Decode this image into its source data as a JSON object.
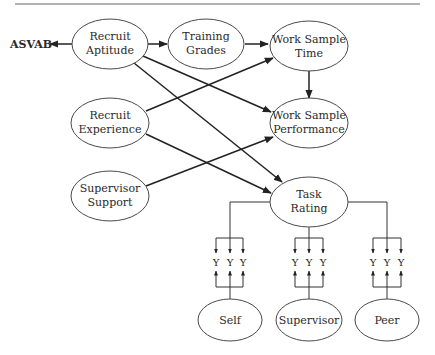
{
  "diagram": {
    "header_rule": true,
    "external_indicator": {
      "label": "ASVAB"
    },
    "nodes": {
      "recruit_aptitude": {
        "line1": "Recruit",
        "line2": "Aptitude"
      },
      "training_grades": {
        "line1": "Training",
        "line2": "Grades"
      },
      "work_sample_time": {
        "line1": "Work Sample",
        "line2": "Time"
      },
      "recruit_experience": {
        "line1": "Recruit",
        "line2": "Experience"
      },
      "work_sample_performance": {
        "line1": "Work Sample",
        "line2": "Performance"
      },
      "supervisor_support": {
        "line1": "Supervisor",
        "line2": "Support"
      },
      "task_rating": {
        "line1": "Task",
        "line2": "Rating"
      },
      "self": {
        "label": "Self"
      },
      "supervisor": {
        "label": "Supervisor"
      },
      "peer": {
        "label": "Peer"
      }
    },
    "indicators": {
      "group_left": [
        "Y",
        "Y",
        "Y"
      ],
      "group_middle": [
        "Y",
        "Y",
        "Y"
      ],
      "group_right": [
        "Y",
        "Y",
        "Y"
      ]
    },
    "edges": [
      {
        "from": "Recruit Aptitude",
        "to": "ASVAB"
      },
      {
        "from": "Recruit Aptitude",
        "to": "Training Grades"
      },
      {
        "from": "Training Grades",
        "to": "Work Sample Time"
      },
      {
        "from": "Work Sample Time",
        "to": "Work Sample Performance"
      },
      {
        "from": "Recruit Aptitude",
        "to": "Work Sample Performance"
      },
      {
        "from": "Recruit Aptitude",
        "to": "Task Rating"
      },
      {
        "from": "Recruit Experience",
        "to": "Work Sample Time"
      },
      {
        "from": "Recruit Experience",
        "to": "Task Rating"
      },
      {
        "from": "Supervisor Support",
        "to": "Work Sample Performance"
      },
      {
        "from": "Task Rating",
        "to": "Y indicators (all groups)"
      },
      {
        "from": "Self",
        "to": "Y indicators (left group)"
      },
      {
        "from": "Supervisor",
        "to": "Y indicators (middle group)"
      },
      {
        "from": "Peer",
        "to": "Y indicators (right group)"
      }
    ]
  }
}
